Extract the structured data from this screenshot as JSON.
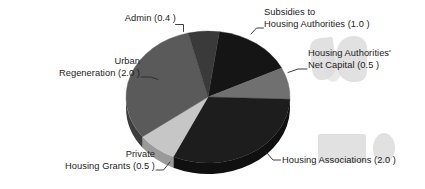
{
  "chart_data": {
    "type": "pie",
    "title": "",
    "subtitle": "",
    "xlabel": "",
    "ylabel": "",
    "grid": false,
    "legend_position": "none",
    "units": "£ billion",
    "total": 6.4,
    "center": {
      "x": 208,
      "y": 97
    },
    "radius": {
      "rx": 82,
      "ry": 66
    },
    "depth_px": 11,
    "start_angle_deg": -82,
    "direction": "clockwise",
    "categories": [
      "Subsidies to Housing Authorities",
      "Housing Authorities' Net Capital",
      "Housing Associations",
      "Private Housing Grants",
      "Urban Regeneration",
      "Admin"
    ],
    "values": [
      1.0,
      0.5,
      2.0,
      0.5,
      2.0,
      0.4
    ],
    "slices": [
      {
        "key": "subsidies",
        "name": "Subsidies to Housing Authorities",
        "value": 1.0,
        "value_text": "(1.0 )",
        "label_line1": "Subsidies to",
        "label_line2": "Housing Authorities (1.0 )",
        "color": "#151515",
        "side_color": "#0b0b0b",
        "start_deg": -82,
        "end_deg": -26
      },
      {
        "key": "net-capital",
        "name": "Housing Authorities' Net Capital",
        "value": 0.5,
        "value_text": "(0.5 )",
        "label_line1": "Housing Authorities'",
        "label_line2": "Net Capital (0.5 )",
        "color": "#707070",
        "side_color": "#4e4e4e",
        "start_deg": -26,
        "end_deg": 2
      },
      {
        "key": "housing-associations",
        "name": "Housing Associations",
        "value": 2.0,
        "value_text": "(2.0 )",
        "label_line1": "Housing Associations (2.0 )",
        "label_line2": "",
        "color": "#1d1d1d",
        "side_color": "#101010",
        "start_deg": 2,
        "end_deg": 115
      },
      {
        "key": "private-housing-grants",
        "name": "Private Housing Grants",
        "value": 0.5,
        "value_text": "(0.5 )",
        "label_line1": "Private",
        "label_line2": "Housing Grants (0.5 )",
        "color": "#c6c6c6",
        "side_color": "#9a9a9a",
        "start_deg": 115,
        "end_deg": 143
      },
      {
        "key": "urban-regeneration",
        "name": "Urban Regeneration",
        "value": 2.0,
        "value_text": "(2.0 )",
        "label_line1": "Urban",
        "label_line2": "Regeneration (2.0 )",
        "color": "#5a5a5a",
        "side_color": "#3d3d3d",
        "start_deg": 143,
        "end_deg": 256
      },
      {
        "key": "admin",
        "name": "Admin",
        "value": 0.4,
        "value_text": "(0.4 )",
        "label_line1": "Admin (0.4 )",
        "label_line2": "",
        "color": "#3a3a3a",
        "side_color": "#262626",
        "start_deg": 256,
        "end_deg": 278
      }
    ]
  },
  "labels": {
    "admin": {
      "line1": "Admin (0.4 )",
      "line2": ""
    },
    "subsidies": {
      "line1": "Subsidies to",
      "line2": "Housing Authorities (1.0 )"
    },
    "net_capital": {
      "line1": "Housing Authorities'",
      "line2": "Net Capital (0.5 )"
    },
    "housing_associations": {
      "line1": "Housing Associations (2.0 )",
      "line2": ""
    },
    "private_grants": {
      "line1": "Private",
      "line2": "Housing Grants (0.5 )"
    },
    "urban_regeneration": {
      "line1": "Urban",
      "line2": "Regeneration (2.0 )"
    }
  },
  "colors": {
    "background": "#ffffff",
    "text": "#1b1b1b",
    "leader_line": "#2b2b2b",
    "ghost_artifact": "#cfcfcf"
  }
}
